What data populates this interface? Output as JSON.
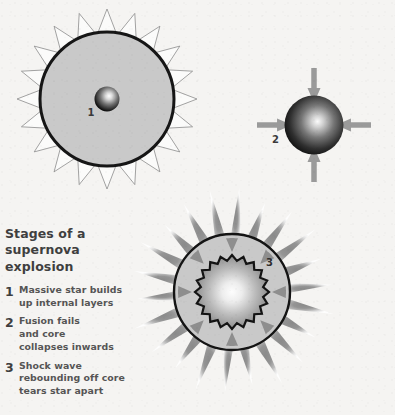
{
  "figure": {
    "background_color": "#f5f4f2",
    "width": 395,
    "height": 415
  },
  "caption": {
    "title": "Stages of a\nsupernova explosion",
    "items": [
      {
        "number": "1",
        "text": "Massive star builds\nup internal layers"
      },
      {
        "number": "2",
        "text": "Fusion fails\nand core\ncollapses inwards"
      },
      {
        "number": "3",
        "text": "Shock wave\nrebounding off core\ntears star apart"
      }
    ]
  },
  "diagrams": [
    {
      "id": "stage-1",
      "label": "1",
      "description": "massive star with internal core",
      "body_fill": "#c9c9c9",
      "outline_color": "#161616",
      "corona_stroke": "#8c8c8c",
      "corona_fill": "#fbfbfa",
      "core_center_color": "#f2f2f2",
      "core_edge_color": "#0d0d0d",
      "spike_count": 20
    },
    {
      "id": "stage-2",
      "label": "2",
      "description": "collapsing core with inward arrows",
      "sphere_center_color": "#f4f4f4",
      "sphere_edge_color": "#111111",
      "arrow_color": "#9a9a9a",
      "arrow_count": 4
    },
    {
      "id": "stage-3",
      "label": "3",
      "description": "shock wave rebounding off core tearing star apart",
      "burst_base_color": "#8f8f8f",
      "burst_tip_color": "#ffffff",
      "shell_fill": "#c9c9c9",
      "outline_color": "#141414",
      "core_center_color": "#fbfbfb",
      "core_edge_color": "#8a8a8a",
      "arrow_color": "#8e8e8e",
      "arrow_count": 8,
      "burst_spike_count": 22,
      "core_spike_count": 20
    }
  ]
}
